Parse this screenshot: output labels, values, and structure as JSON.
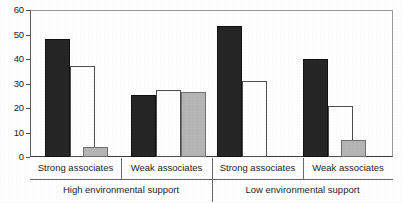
{
  "chart_data": {
    "type": "bar",
    "title": "",
    "xlabel": "",
    "ylabel": "",
    "ylim": [
      0,
      60
    ],
    "yticks": [
      0,
      10,
      20,
      30,
      40,
      50,
      60
    ],
    "ytick_labels": [
      "0",
      "10",
      "20",
      "30",
      "40",
      "50",
      "60"
    ],
    "grid": false,
    "legend": "none",
    "categories": [
      "Strong associates",
      "Weak associates",
      "Strong associates",
      "Weak associates"
    ],
    "group_labels": [
      "High environmental support",
      "Low environmental support"
    ],
    "series": [
      {
        "name": "black",
        "color": "#262626",
        "values": [
          48,
          25.5,
          53.5,
          40
        ]
      },
      {
        "name": "white",
        "color": "#ffffff",
        "values": [
          37,
          27.5,
          31,
          21
        ]
      },
      {
        "name": "gray",
        "color": "#b5b5b5",
        "values": [
          4,
          26.5,
          null,
          7
        ]
      }
    ],
    "groups": [
      {
        "super": "High environmental support",
        "category": "Strong associates",
        "bars": [
          {
            "series": "black",
            "value": 48
          },
          {
            "series": "white",
            "value": 37
          },
          {
            "series": "gray",
            "value": 4
          }
        ]
      },
      {
        "super": "High environmental support",
        "category": "Weak associates",
        "bars": [
          {
            "series": "black",
            "value": 25.5
          },
          {
            "series": "white",
            "value": 27.5
          },
          {
            "series": "gray",
            "value": 26.5
          }
        ]
      },
      {
        "super": "Low environmental support",
        "category": "Strong associates",
        "bars": [
          {
            "series": "black",
            "value": 53.5
          },
          {
            "series": "white",
            "value": 31
          }
        ]
      },
      {
        "super": "Low environmental support",
        "category": "Weak associates",
        "bars": [
          {
            "series": "black",
            "value": 40
          },
          {
            "series": "white",
            "value": 21
          },
          {
            "series": "gray",
            "value": 7
          }
        ]
      }
    ]
  },
  "axis": {
    "ticks": [
      {
        "label": "60",
        "value": 60
      },
      {
        "label": "50",
        "value": 50
      },
      {
        "label": "40",
        "value": 40
      },
      {
        "label": "30",
        "value": 30
      },
      {
        "label": "20",
        "value": 20
      },
      {
        "label": "10",
        "value": 10
      },
      {
        "label": "0",
        "value": 0
      }
    ]
  },
  "labels": {
    "cat0": "Strong associates",
    "cat1": "Weak associates",
    "cat2": "Strong associates",
    "cat3": "Weak associates",
    "super0": "High environmental support",
    "super1": "Low environmental support"
  }
}
